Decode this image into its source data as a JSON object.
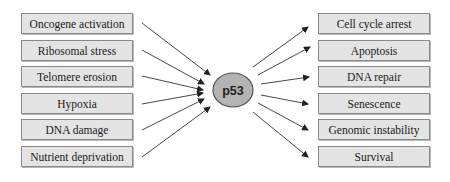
{
  "diagram": {
    "hub": {
      "label": "p53",
      "fill": "#b4b4b4",
      "stroke": "#555555"
    },
    "inputs": [
      {
        "label": "Oncogene activation"
      },
      {
        "label": "Ribosomal stress"
      },
      {
        "label": "Telomere erosion"
      },
      {
        "label": "Hypoxia"
      },
      {
        "label": "DNA damage"
      },
      {
        "label": "Nutrient deprivation"
      }
    ],
    "outputs": [
      {
        "label": "Cell cycle arrest"
      },
      {
        "label": "Apoptosis"
      },
      {
        "label": "DNA repair"
      },
      {
        "label": "Senescence"
      },
      {
        "label": "Genomic instability"
      },
      {
        "label": "Survival"
      }
    ],
    "colors": {
      "box_fill": "#e4e4e4",
      "box_border": "#8a8a8a",
      "arrow": "#333333"
    }
  }
}
